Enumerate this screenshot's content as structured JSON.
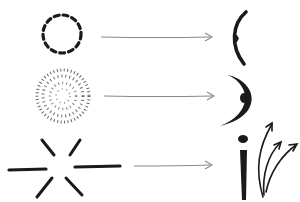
{
  "diagram": {
    "type": "transformation-flow",
    "rows": [
      {
        "source": "dashed-circle",
        "target": "small-arc-with-dot",
        "arrow": "right-arrow"
      },
      {
        "source": "stippled-circle",
        "target": "crescent-with-dot",
        "arrow": "right-arrow"
      },
      {
        "source": "radiating-strokes",
        "target": "figure-with-upward-arrows",
        "arrow": "right-arrow"
      }
    ],
    "colors": {
      "ink": "#1a1a1a",
      "arrow": "#888888",
      "background": "#ffffff"
    }
  }
}
